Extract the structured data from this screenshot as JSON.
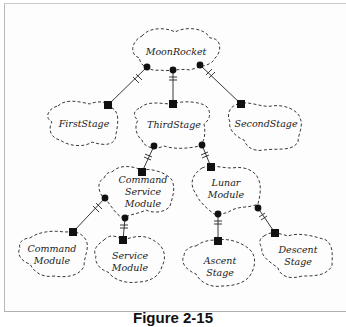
{
  "figure": {
    "caption": "Figure 2-15"
  },
  "diagram": {
    "type": "class-category-containment",
    "nodes": {
      "moon_rocket": {
        "label_lines": [
          "MoonRocket"
        ]
      },
      "first_stage": {
        "label_lines": [
          "FirstStage"
        ]
      },
      "third_stage": {
        "label_lines": [
          "ThirdStage"
        ]
      },
      "second_stage": {
        "label_lines": [
          "SecondStage"
        ]
      },
      "command_service_module": {
        "label_lines": [
          "Command",
          "Service",
          "Module"
        ]
      },
      "lunar_module": {
        "label_lines": [
          "Lunar",
          "Module"
        ]
      },
      "command_module": {
        "label_lines": [
          "Command",
          "Module"
        ]
      },
      "service_module": {
        "label_lines": [
          "Service",
          "Module"
        ]
      },
      "ascent_stage": {
        "label_lines": [
          "Ascent",
          "Stage"
        ]
      },
      "descent_stage": {
        "label_lines": [
          "Descent",
          "Stage"
        ]
      }
    },
    "edges": [
      {
        "from": "MoonRocket",
        "to": "FirstStage",
        "whole_end": "filled-circle",
        "part_end": "filled-square",
        "cardinality_mark": "double-tick"
      },
      {
        "from": "MoonRocket",
        "to": "ThirdStage",
        "whole_end": "filled-circle",
        "part_end": "filled-square",
        "cardinality_mark": "double-tick"
      },
      {
        "from": "MoonRocket",
        "to": "SecondStage",
        "whole_end": "filled-circle",
        "part_end": "filled-square",
        "cardinality_mark": "double-tick"
      },
      {
        "from": "ThirdStage",
        "to": "CommandServiceModule",
        "whole_end": "filled-circle",
        "part_end": "filled-square",
        "cardinality_mark": "double-tick"
      },
      {
        "from": "ThirdStage",
        "to": "LunarModule",
        "whole_end": "filled-circle",
        "part_end": "filled-square",
        "cardinality_mark": "double-tick"
      },
      {
        "from": "CommandServiceModule",
        "to": "CommandModule",
        "whole_end": "filled-circle",
        "part_end": "filled-square",
        "cardinality_mark": "double-tick"
      },
      {
        "from": "CommandServiceModule",
        "to": "ServiceModule",
        "whole_end": "filled-circle",
        "part_end": "filled-square",
        "cardinality_mark": "double-tick"
      },
      {
        "from": "LunarModule",
        "to": "AscentStage",
        "whole_end": "filled-circle",
        "part_end": "filled-square",
        "cardinality_mark": "double-tick"
      },
      {
        "from": "LunarModule",
        "to": "DescentStage",
        "whole_end": "filled-circle",
        "part_end": "filled-square",
        "cardinality_mark": "double-tick"
      }
    ]
  }
}
